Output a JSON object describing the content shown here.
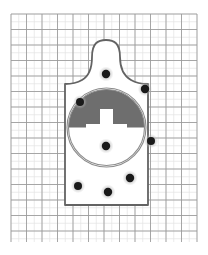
{
  "figure": {
    "name": "shooting-target-scoresheet",
    "background_color": "#ffffff",
    "width": 208,
    "height": 255
  },
  "grid": {
    "name": "measurement-grid",
    "x": 11,
    "y": 14,
    "width": 186,
    "height": 228,
    "minor_spacing": 7.75,
    "major_spacing": 15.5,
    "minor_color": "#e2e2e2",
    "major_color": "#9a9a9a",
    "minor_cols": 24,
    "minor_rows": 29,
    "major_cols": 12,
    "major_rows": 15,
    "show_grid": true
  },
  "silhouette": {
    "name": "humanoid-target-silhouette",
    "outline_color": "#636363",
    "outline_width": 1.8,
    "fill_color": "#ffffff",
    "head_top_y": 40,
    "head_left_x": 92,
    "head_right_x": 120,
    "body_left_x": 65,
    "body_right_x": 148,
    "shoulder_y": 84,
    "bottom_y": 205,
    "path": "M 92,57 C 92,43 98,40 106,40 C 114,40 120,43 120,57 C 120,68 124,76 131,80 C 136,83 140,84 148,84 L 148,205 L 65,205 L 65,84 C 73,84 77,83 82,80 C 89,76 92,68 92,57 Z"
  },
  "scoring_circle": {
    "name": "scoring-circle",
    "center_x": 106.5,
    "center_y": 127.5,
    "radius": 38,
    "outer_ring_radius": 39.5,
    "ring_color": "#8c8c8c",
    "ring_width": 1.1,
    "upper_half_color": "#6e6e6e",
    "lower_half_color": "#ffffff",
    "divider_y": 127.5
  },
  "aim_mark": {
    "name": "cross-aim-mark",
    "color": "#ffffff",
    "stem_x": 100,
    "stem_y": 109,
    "stem_width": 13,
    "stem_height": 19,
    "arm_x": 86,
    "arm_y": 124,
    "arm_width": 41,
    "arm_height": 9
  },
  "bullet_holes": {
    "name": "bullet-hole-group",
    "count": 8,
    "core_color": "#1a1a1a",
    "halo_color": "#b4b4b4",
    "items": [
      {
        "label": "hole-head",
        "cx": 106,
        "cy": 74,
        "r": 4.2,
        "halo_r": 7.5
      },
      {
        "label": "hole-right-shoulder",
        "cx": 145,
        "cy": 89,
        "r": 4.2,
        "halo_r": 7.2
      },
      {
        "label": "hole-left-shoulder",
        "cx": 80,
        "cy": 102,
        "r": 4.0,
        "halo_r": 7.0
      },
      {
        "label": "hole-right-edge",
        "cx": 151,
        "cy": 141,
        "r": 4.0,
        "halo_r": 7.2
      },
      {
        "label": "hole-center-low",
        "cx": 106,
        "cy": 146,
        "r": 4.2,
        "halo_r": 7.5
      },
      {
        "label": "hole-lower-right",
        "cx": 130,
        "cy": 178,
        "r": 4.2,
        "halo_r": 7.5
      },
      {
        "label": "hole-lower-left",
        "cx": 78,
        "cy": 186,
        "r": 4.0,
        "halo_r": 7.2
      },
      {
        "label": "hole-bottom-center",
        "cx": 108,
        "cy": 192,
        "r": 4.2,
        "halo_r": 7.5
      }
    ]
  },
  "chart_data": {
    "type": "scatter",
    "xlabel": "",
    "ylabel": "",
    "xlim": [
      11,
      197
    ],
    "ylim": [
      14,
      242
    ],
    "grid": true,
    "legend": "none",
    "series": [
      {
        "name": "bullet holes",
        "points": [
          [
            106,
            74
          ],
          [
            145,
            89
          ],
          [
            80,
            102
          ],
          [
            151,
            141
          ],
          [
            106,
            146
          ],
          [
            130,
            178
          ],
          [
            78,
            186
          ],
          [
            108,
            192
          ]
        ]
      }
    ],
    "annotations": [
      "8 impacts recorded",
      "scoring circle centered at (106.5, 127.5) radius 38",
      "upper half of scoring circle shaded gray, lower half white",
      "white cross aim mark at circle center"
    ]
  }
}
